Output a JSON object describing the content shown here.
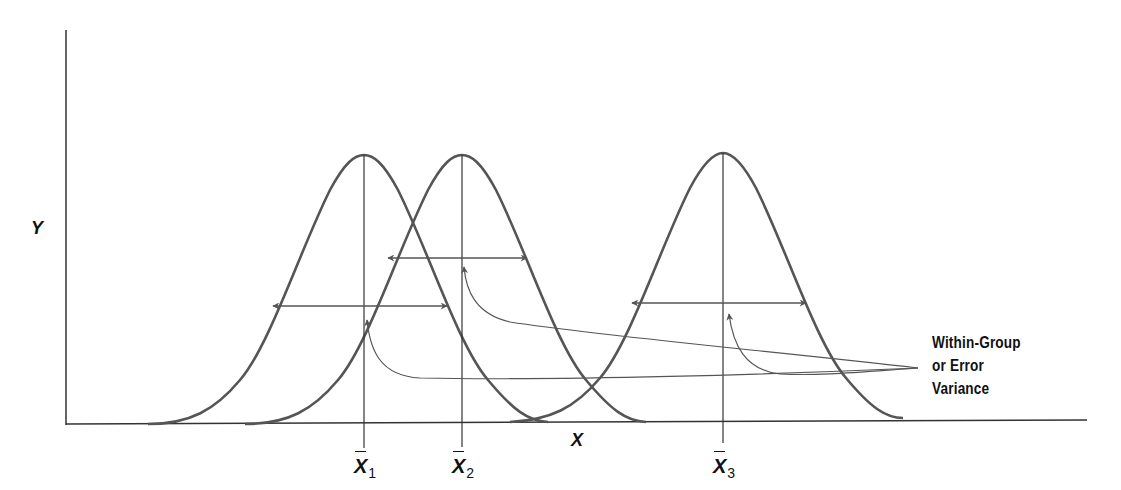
{
  "diagram": {
    "axes": {
      "x_label": "X",
      "y_label": "Y"
    },
    "distributions": [
      {
        "name": "group-1",
        "mean_symbol": "X",
        "subscript": "1",
        "center_x_px": 364
      },
      {
        "name": "group-2",
        "mean_symbol": "X",
        "subscript": "2",
        "center_x_px": 462
      },
      {
        "name": "group-3",
        "mean_symbol": "X",
        "subscript": "3",
        "center_x_px": 723
      }
    ],
    "annotation": {
      "line1": "Within-Group",
      "line2": "or Error",
      "line3": "Variance"
    },
    "colors": {
      "curve": "#555555",
      "axis": "#333333",
      "text": "#111111",
      "background": "#ffffff"
    }
  }
}
